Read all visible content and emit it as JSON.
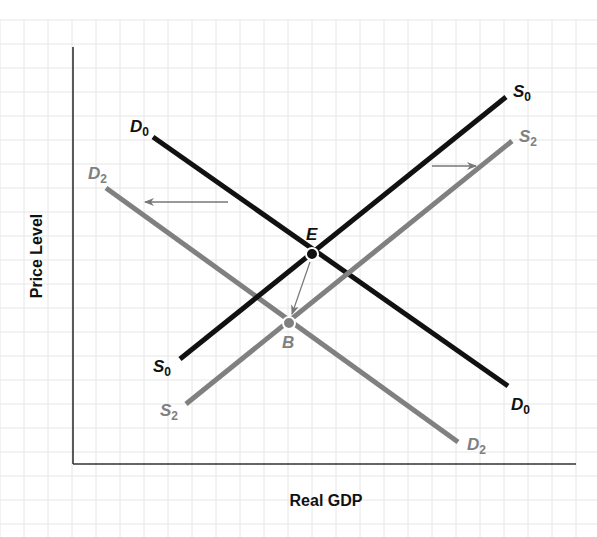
{
  "chart_data": {
    "type": "line",
    "title": "",
    "xlabel": "Real GDP",
    "ylabel": "Price Level",
    "grid": true,
    "colors": {
      "primary": "#111111",
      "shifted": "#808080",
      "grid": "#e4e4e4",
      "axis": "#333333"
    },
    "series": [
      {
        "name": "D0",
        "label_main": "D",
        "label_sub": "0",
        "kind": "aggregate demand",
        "color": "#111111",
        "points": [
          [
            153,
            137
          ],
          [
            508,
            386
          ]
        ]
      },
      {
        "name": "D2",
        "label_main": "D",
        "label_sub": "2",
        "kind": "aggregate demand (shifted left)",
        "color": "#808080",
        "points": [
          [
            106,
            188
          ],
          [
            458,
            442
          ]
        ]
      },
      {
        "name": "S0",
        "label_main": "S",
        "label_sub": "0",
        "kind": "aggregate supply",
        "color": "#111111",
        "points": [
          [
            180,
            359
          ],
          [
            506,
            97
          ]
        ]
      },
      {
        "name": "S2",
        "label_main": "S",
        "label_sub": "2",
        "kind": "aggregate supply (shifted right)",
        "color": "#808080",
        "points": [
          [
            186,
            404
          ],
          [
            512,
            141
          ]
        ]
      }
    ],
    "points": [
      {
        "name": "E",
        "description": "initial equilibrium (D0 ∩ S0)",
        "x": 312,
        "y": 254,
        "color": "#111111"
      },
      {
        "name": "B",
        "description": "new equilibrium (D2 ∩ S2)",
        "x": 289,
        "y": 323,
        "color": "#808080"
      }
    ],
    "annotations": [
      {
        "type": "arrow",
        "description": "demand shifts left",
        "from": [
          228,
          202
        ],
        "to": [
          145,
          202
        ]
      },
      {
        "type": "arrow",
        "description": "supply shifts right",
        "from": [
          432,
          166
        ],
        "to": [
          476,
          166
        ]
      },
      {
        "type": "arrow",
        "description": "equilibrium moves from E to B",
        "from": [
          310,
          262
        ],
        "to": [
          292,
          314
        ]
      }
    ]
  },
  "labels": {
    "xlabel": "Real GDP",
    "ylabel": "Price Level",
    "D0_main": "D",
    "D0_sub": "0",
    "D2_main": "D",
    "D2_sub": "2",
    "S0_main": "S",
    "S0_sub": "0",
    "S2_main": "S",
    "S2_sub": "2",
    "E": "E",
    "B": "B"
  }
}
